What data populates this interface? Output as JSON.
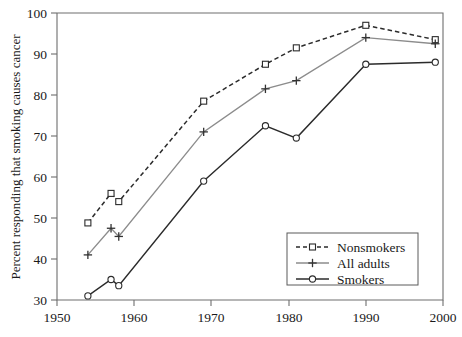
{
  "chart_data": {
    "type": "line",
    "title": "",
    "xlabel": "",
    "ylabel": "Percent responding that smoking causes cancer",
    "xlim": [
      1950,
      2000
    ],
    "ylim": [
      30,
      100
    ],
    "xticks": [
      1950,
      1960,
      1970,
      1980,
      1990,
      2000
    ],
    "yticks": [
      30,
      40,
      50,
      60,
      70,
      80,
      90,
      100
    ],
    "grid": false,
    "legend_position": "lower-right",
    "series": [
      {
        "name": "Nonsmokers",
        "color": "#2b2b2b",
        "linestyle": "dashed",
        "marker": "open-square",
        "x": [
          1954,
          1957,
          1958,
          1969,
          1977,
          1981,
          1990,
          1999
        ],
        "values": [
          48.8,
          56.0,
          54.0,
          78.5,
          87.5,
          91.5,
          97.0,
          93.5
        ]
      },
      {
        "name": "All adults",
        "color": "#8c8c8c",
        "linestyle": "solid",
        "marker": "plus",
        "x": [
          1954,
          1957,
          1958,
          1969,
          1977,
          1981,
          1990,
          1999
        ],
        "values": [
          41.0,
          47.5,
          45.5,
          71.0,
          81.5,
          83.5,
          94.0,
          92.5
        ]
      },
      {
        "name": "Smokers",
        "color": "#2b2b2b",
        "linestyle": "solid",
        "marker": "open-circle",
        "x": [
          1954,
          1957,
          1958,
          1969,
          1977,
          1981,
          1990,
          1999
        ],
        "values": [
          31.0,
          35.0,
          33.5,
          59.0,
          72.5,
          69.5,
          87.5,
          88.0
        ]
      }
    ],
    "legend_entries": [
      {
        "label": "Nonsmokers",
        "color": "#2b2b2b",
        "linestyle": "dashed",
        "marker": "open-square"
      },
      {
        "label": "All adults",
        "color": "#8c8c8c",
        "linestyle": "solid",
        "marker": "plus"
      },
      {
        "label": "Smokers",
        "color": "#2b2b2b",
        "linestyle": "solid",
        "marker": "open-circle"
      }
    ]
  },
  "axes": {
    "y_title": "Percent responding that smoking causes cancer",
    "y_tick_labels": [
      "30",
      "40",
      "50",
      "60",
      "70",
      "80",
      "90",
      "100"
    ],
    "x_tick_labels": [
      "1950",
      "1960",
      "1970",
      "1980",
      "1990",
      "2000"
    ]
  },
  "legend": {
    "items": [
      {
        "label": "Nonsmokers"
      },
      {
        "label": "All adults"
      },
      {
        "label": "Smokers"
      }
    ]
  }
}
